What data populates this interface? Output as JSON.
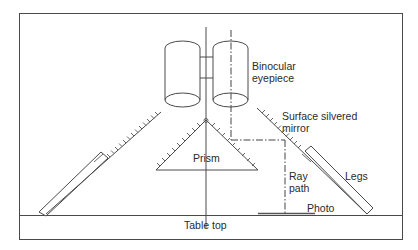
{
  "diagram": {
    "type": "schematic",
    "labels": {
      "eyepiece": [
        "Binocular",
        "eyepiece"
      ],
      "mirror": [
        "Surface silvered",
        "mirror"
      ],
      "prism": "Prism",
      "ray_path": [
        "Ray",
        "path"
      ],
      "legs": "Legs",
      "photo": "Photo",
      "table_top": "Table top"
    },
    "colors": {
      "line": "#4a4a4a",
      "text": "#2a2a2a",
      "background": "#ffffff"
    }
  }
}
